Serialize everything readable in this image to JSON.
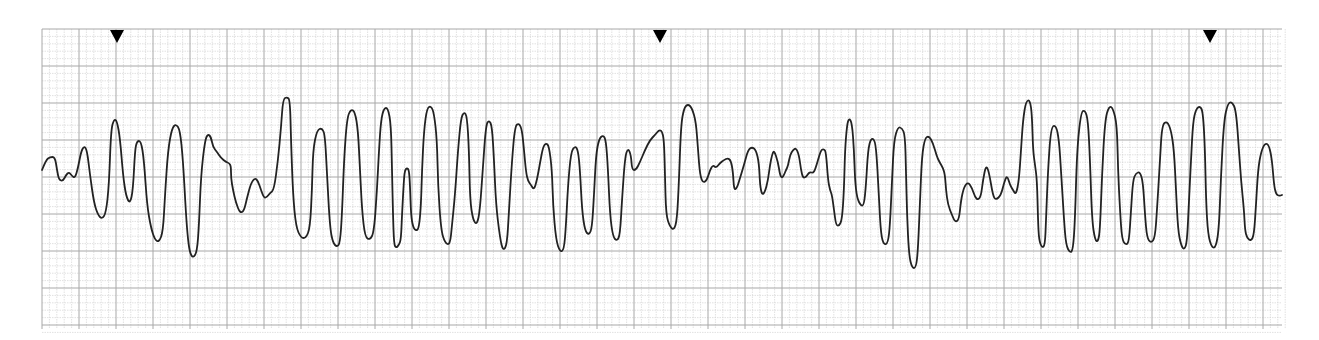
{
  "chart_data": {
    "type": "line",
    "title": "",
    "subtitle": "",
    "xlabel": "",
    "ylabel": "",
    "grid": {
      "on": true,
      "small_square_px": 7.4,
      "large_square_every": 5,
      "minor_color": "#d4d4d4",
      "major_color": "#a8a8a8",
      "left": 42,
      "top": 29,
      "right": 1282,
      "bottom": 329
    },
    "markers": {
      "type": "triangle-down",
      "color": "#000000",
      "x": [
        117,
        660,
        1210
      ],
      "y": 33
    },
    "trace_color": "#222222",
    "trace_points": [
      [
        42,
        170
      ],
      [
        46,
        160
      ],
      [
        50,
        157
      ],
      [
        55,
        157
      ],
      [
        57,
        170
      ],
      [
        59,
        180
      ],
      [
        63,
        181
      ],
      [
        66,
        175
      ],
      [
        69,
        172
      ],
      [
        72,
        176
      ],
      [
        75,
        178
      ],
      [
        78,
        168
      ],
      [
        81,
        152
      ],
      [
        84,
        146
      ],
      [
        87,
        150
      ],
      [
        90,
        175
      ],
      [
        94,
        203
      ],
      [
        98,
        215
      ],
      [
        102,
        219
      ],
      [
        106,
        213
      ],
      [
        109,
        185
      ],
      [
        111,
        130
      ],
      [
        114,
        119
      ],
      [
        117,
        121
      ],
      [
        120,
        138
      ],
      [
        123,
        175
      ],
      [
        126,
        196
      ],
      [
        130,
        204
      ],
      [
        133,
        190
      ],
      [
        135,
        150
      ],
      [
        137,
        141
      ],
      [
        141,
        141
      ],
      [
        144,
        160
      ],
      [
        147,
        205
      ],
      [
        151,
        228
      ],
      [
        155,
        240
      ],
      [
        159,
        242
      ],
      [
        163,
        232
      ],
      [
        165,
        195
      ],
      [
        168,
        150
      ],
      [
        172,
        128
      ],
      [
        176,
        124
      ],
      [
        180,
        130
      ],
      [
        183,
        160
      ],
      [
        186,
        215
      ],
      [
        188,
        240
      ],
      [
        190,
        253
      ],
      [
        193,
        258
      ],
      [
        197,
        252
      ],
      [
        199,
        225
      ],
      [
        201,
        175
      ],
      [
        205,
        140
      ],
      [
        208,
        134
      ],
      [
        211,
        137
      ],
      [
        213,
        147
      ],
      [
        217,
        152
      ],
      [
        221,
        158
      ],
      [
        226,
        162
      ],
      [
        229,
        163
      ],
      [
        231,
        166
      ],
      [
        231,
        178
      ],
      [
        233,
        190
      ],
      [
        236,
        203
      ],
      [
        240,
        213
      ],
      [
        244,
        211
      ],
      [
        247,
        198
      ],
      [
        251,
        183
      ],
      [
        255,
        178
      ],
      [
        258,
        181
      ],
      [
        261,
        190
      ],
      [
        264,
        198
      ],
      [
        267,
        197
      ],
      [
        270,
        193
      ],
      [
        274,
        190
      ],
      [
        278,
        160
      ],
      [
        281,
        128
      ],
      [
        283,
        99
      ],
      [
        287,
        97
      ],
      [
        290,
        100
      ],
      [
        291,
        140
      ],
      [
        293,
        195
      ],
      [
        296,
        227
      ],
      [
        301,
        238
      ],
      [
        306,
        238
      ],
      [
        310,
        228
      ],
      [
        312,
        190
      ],
      [
        313,
        150
      ],
      [
        317,
        130
      ],
      [
        322,
        128
      ],
      [
        325,
        135
      ],
      [
        327,
        175
      ],
      [
        330,
        228
      ],
      [
        333,
        243
      ],
      [
        337,
        247
      ],
      [
        340,
        243
      ],
      [
        342,
        215
      ],
      [
        344,
        160
      ],
      [
        347,
        118
      ],
      [
        351,
        109
      ],
      [
        355,
        112
      ],
      [
        358,
        130
      ],
      [
        360,
        170
      ],
      [
        362,
        210
      ],
      [
        365,
        237
      ],
      [
        370,
        240
      ],
      [
        374,
        232
      ],
      [
        377,
        190
      ],
      [
        379,
        150
      ],
      [
        381,
        120
      ],
      [
        384,
        108
      ],
      [
        388,
        108
      ],
      [
        391,
        125
      ],
      [
        392,
        170
      ],
      [
        393,
        215
      ],
      [
        394,
        244
      ],
      [
        396,
        248
      ],
      [
        399,
        245
      ],
      [
        401,
        239
      ],
      [
        402,
        215
      ],
      [
        404,
        178
      ],
      [
        405,
        170
      ],
      [
        407,
        168
      ],
      [
        409,
        170
      ],
      [
        410,
        185
      ],
      [
        411,
        215
      ],
      [
        413,
        227
      ],
      [
        416,
        231
      ],
      [
        419,
        228
      ],
      [
        421,
        205
      ],
      [
        422,
        170
      ],
      [
        424,
        130
      ],
      [
        427,
        108
      ],
      [
        431,
        106
      ],
      [
        434,
        113
      ],
      [
        437,
        140
      ],
      [
        438,
        185
      ],
      [
        441,
        230
      ],
      [
        445,
        243
      ],
      [
        450,
        245
      ],
      [
        452,
        225
      ],
      [
        455,
        195
      ],
      [
        458,
        150
      ],
      [
        461,
        118
      ],
      [
        464,
        112
      ],
      [
        467,
        116
      ],
      [
        469,
        150
      ],
      [
        470,
        200
      ],
      [
        473,
        220
      ],
      [
        477,
        225
      ],
      [
        480,
        210
      ],
      [
        483,
        165
      ],
      [
        486,
        125
      ],
      [
        489,
        120
      ],
      [
        492,
        126
      ],
      [
        494,
        160
      ],
      [
        496,
        205
      ],
      [
        500,
        238
      ],
      [
        503,
        251
      ],
      [
        507,
        245
      ],
      [
        509,
        210
      ],
      [
        512,
        160
      ],
      [
        515,
        126
      ],
      [
        519,
        123
      ],
      [
        522,
        130
      ],
      [
        524,
        150
      ],
      [
        526,
        172
      ],
      [
        528,
        181
      ],
      [
        531,
        185
      ],
      [
        534,
        190
      ],
      [
        537,
        180
      ],
      [
        540,
        163
      ],
      [
        543,
        147
      ],
      [
        546,
        143
      ],
      [
        549,
        146
      ],
      [
        552,
        170
      ],
      [
        553,
        205
      ],
      [
        556,
        240
      ],
      [
        560,
        252
      ],
      [
        564,
        250
      ],
      [
        566,
        225
      ],
      [
        568,
        185
      ],
      [
        571,
        152
      ],
      [
        575,
        146
      ],
      [
        578,
        150
      ],
      [
        580,
        170
      ],
      [
        582,
        210
      ],
      [
        585,
        231
      ],
      [
        589,
        235
      ],
      [
        592,
        228
      ],
      [
        594,
        195
      ],
      [
        596,
        155
      ],
      [
        599,
        139
      ],
      [
        603,
        135
      ],
      [
        606,
        140
      ],
      [
        608,
        170
      ],
      [
        610,
        215
      ],
      [
        613,
        237
      ],
      [
        617,
        241
      ],
      [
        620,
        235
      ],
      [
        622,
        200
      ],
      [
        625,
        157
      ],
      [
        628,
        148
      ],
      [
        631,
        155
      ],
      [
        632,
        170
      ],
      [
        636,
        170
      ],
      [
        640,
        162
      ],
      [
        645,
        150
      ],
      [
        650,
        140
      ],
      [
        655,
        135
      ],
      [
        659,
        130
      ],
      [
        662,
        131
      ],
      [
        664,
        140
      ],
      [
        665,
        175
      ],
      [
        666,
        215
      ],
      [
        670,
        227
      ],
      [
        674,
        230
      ],
      [
        677,
        220
      ],
      [
        679,
        180
      ],
      [
        681,
        125
      ],
      [
        684,
        108
      ],
      [
        688,
        104
      ],
      [
        692,
        108
      ],
      [
        696,
        122
      ],
      [
        698,
        150
      ],
      [
        700,
        175
      ],
      [
        703,
        183
      ],
      [
        707,
        180
      ],
      [
        710,
        170
      ],
      [
        713,
        165
      ],
      [
        716,
        168
      ],
      [
        720,
        163
      ],
      [
        724,
        160
      ],
      [
        728,
        158
      ],
      [
        731,
        161
      ],
      [
        733,
        172
      ],
      [
        734,
        190
      ],
      [
        737,
        188
      ],
      [
        740,
        178
      ],
      [
        744,
        165
      ],
      [
        748,
        150
      ],
      [
        752,
        147
      ],
      [
        756,
        150
      ],
      [
        759,
        163
      ],
      [
        760,
        185
      ],
      [
        762,
        195
      ],
      [
        765,
        192
      ],
      [
        768,
        180
      ],
      [
        770,
        165
      ],
      [
        772,
        155
      ],
      [
        774,
        150
      ],
      [
        778,
        162
      ],
      [
        780,
        175
      ],
      [
        782,
        178
      ],
      [
        784,
        175
      ],
      [
        786,
        170
      ],
      [
        788,
        166
      ],
      [
        790,
        155
      ],
      [
        793,
        150
      ],
      [
        796,
        148
      ],
      [
        799,
        155
      ],
      [
        801,
        170
      ],
      [
        803,
        178
      ],
      [
        806,
        177
      ],
      [
        808,
        174
      ],
      [
        810,
        172
      ],
      [
        813,
        173
      ],
      [
        815,
        170
      ],
      [
        818,
        160
      ],
      [
        821,
        150
      ],
      [
        824,
        149
      ],
      [
        826,
        152
      ],
      [
        828,
        180
      ],
      [
        830,
        190
      ],
      [
        832,
        195
      ],
      [
        834,
        210
      ],
      [
        836,
        225
      ],
      [
        839,
        226
      ],
      [
        842,
        220
      ],
      [
        844,
        190
      ],
      [
        845,
        150
      ],
      [
        847,
        125
      ],
      [
        849,
        118
      ],
      [
        852,
        123
      ],
      [
        854,
        150
      ],
      [
        855,
        180
      ],
      [
        857,
        198
      ],
      [
        861,
        206
      ],
      [
        864,
        205
      ],
      [
        866,
        185
      ],
      [
        868,
        150
      ],
      [
        871,
        138
      ],
      [
        875,
        140
      ],
      [
        877,
        160
      ],
      [
        879,
        200
      ],
      [
        881,
        235
      ],
      [
        884,
        245
      ],
      [
        888,
        243
      ],
      [
        890,
        225
      ],
      [
        892,
        180
      ],
      [
        894,
        140
      ],
      [
        898,
        127
      ],
      [
        902,
        128
      ],
      [
        905,
        135
      ],
      [
        906,
        170
      ],
      [
        907,
        215
      ],
      [
        909,
        255
      ],
      [
        912,
        268
      ],
      [
        916,
        268
      ],
      [
        918,
        250
      ],
      [
        920,
        200
      ],
      [
        922,
        155
      ],
      [
        925,
        138
      ],
      [
        929,
        136
      ],
      [
        933,
        143
      ],
      [
        937,
        157
      ],
      [
        940,
        163
      ],
      [
        943,
        168
      ],
      [
        945,
        175
      ],
      [
        946,
        190
      ],
      [
        948,
        205
      ],
      [
        952,
        215
      ],
      [
        955,
        222
      ],
      [
        959,
        220
      ],
      [
        961,
        200
      ],
      [
        964,
        187
      ],
      [
        968,
        182
      ],
      [
        972,
        188
      ],
      [
        975,
        197
      ],
      [
        978,
        200
      ],
      [
        981,
        196
      ],
      [
        983,
        180
      ],
      [
        986,
        165
      ],
      [
        989,
        172
      ],
      [
        993,
        196
      ],
      [
        996,
        200
      ],
      [
        1001,
        195
      ],
      [
        1004,
        183
      ],
      [
        1007,
        175
      ],
      [
        1010,
        185
      ],
      [
        1013,
        190
      ],
      [
        1016,
        195
      ],
      [
        1019,
        180
      ],
      [
        1021,
        150
      ],
      [
        1023,
        120
      ],
      [
        1026,
        101
      ],
      [
        1030,
        100
      ],
      [
        1032,
        115
      ],
      [
        1033,
        150
      ],
      [
        1035,
        165
      ],
      [
        1037,
        180
      ],
      [
        1038,
        220
      ],
      [
        1039,
        240
      ],
      [
        1042,
        248
      ],
      [
        1045,
        245
      ],
      [
        1046,
        220
      ],
      [
        1048,
        170
      ],
      [
        1051,
        127
      ],
      [
        1056,
        125
      ],
      [
        1059,
        140
      ],
      [
        1061,
        170
      ],
      [
        1064,
        220
      ],
      [
        1066,
        245
      ],
      [
        1070,
        253
      ],
      [
        1073,
        250
      ],
      [
        1075,
        220
      ],
      [
        1077,
        150
      ],
      [
        1081,
        112
      ],
      [
        1085,
        110
      ],
      [
        1088,
        120
      ],
      [
        1090,
        160
      ],
      [
        1092,
        220
      ],
      [
        1095,
        240
      ],
      [
        1098,
        242
      ],
      [
        1100,
        230
      ],
      [
        1102,
        175
      ],
      [
        1105,
        120
      ],
      [
        1109,
        106
      ],
      [
        1113,
        108
      ],
      [
        1117,
        125
      ],
      [
        1118,
        170
      ],
      [
        1120,
        210
      ],
      [
        1122,
        240
      ],
      [
        1126,
        245
      ],
      [
        1129,
        242
      ],
      [
        1131,
        210
      ],
      [
        1133,
        180
      ],
      [
        1136,
        173
      ],
      [
        1140,
        172
      ],
      [
        1143,
        182
      ],
      [
        1145,
        215
      ],
      [
        1147,
        238
      ],
      [
        1151,
        243
      ],
      [
        1155,
        238
      ],
      [
        1157,
        210
      ],
      [
        1160,
        160
      ],
      [
        1162,
        125
      ],
      [
        1167,
        121
      ],
      [
        1171,
        130
      ],
      [
        1174,
        150
      ],
      [
        1176,
        190
      ],
      [
        1178,
        230
      ],
      [
        1181,
        245
      ],
      [
        1184,
        250
      ],
      [
        1187,
        243
      ],
      [
        1189,
        200
      ],
      [
        1191,
        160
      ],
      [
        1193,
        122
      ],
      [
        1196,
        109
      ],
      [
        1200,
        106
      ],
      [
        1203,
        112
      ],
      [
        1205,
        150
      ],
      [
        1206,
        200
      ],
      [
        1208,
        235
      ],
      [
        1212,
        248
      ],
      [
        1216,
        247
      ],
      [
        1219,
        228
      ],
      [
        1221,
        175
      ],
      [
        1224,
        120
      ],
      [
        1228,
        103
      ],
      [
        1232,
        102
      ],
      [
        1236,
        110
      ],
      [
        1239,
        150
      ],
      [
        1241,
        180
      ],
      [
        1244,
        210
      ],
      [
        1245,
        230
      ],
      [
        1247,
        238
      ],
      [
        1251,
        241
      ],
      [
        1254,
        235
      ],
      [
        1256,
        205
      ],
      [
        1258,
        170
      ],
      [
        1261,
        152
      ],
      [
        1265,
        143
      ],
      [
        1269,
        145
      ],
      [
        1272,
        160
      ],
      [
        1274,
        185
      ],
      [
        1276,
        194
      ],
      [
        1279,
        196
      ],
      [
        1282,
        195
      ]
    ],
    "rhythm_label": ""
  }
}
